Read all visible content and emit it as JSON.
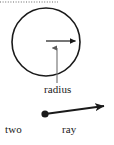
{
  "figure": {
    "background_color": "#ffffff",
    "stroke_color": "#1a1a1a",
    "width": 114,
    "height": 145
  },
  "top_edge": {
    "name": "dotted-rule",
    "style": "dotted",
    "color": "#9a9a9a",
    "y": 2,
    "x_start": 0,
    "x_end": 58
  },
  "circle": {
    "center_x": 46,
    "center_y": 42,
    "radius": 34,
    "stroke_width": 1.6,
    "stroke_color": "#1a1a1a",
    "fill": "none"
  },
  "radius_arrow": {
    "name": "radius-arrow",
    "from_x": 46,
    "from_y": 41,
    "to_x": 79,
    "to_y": 41,
    "stroke_width": 1.2,
    "stroke_color": "#1a1a1a"
  },
  "leader_line": {
    "name": "radius-leader-line",
    "from_x": 57,
    "from_y": 83,
    "to_x": 57,
    "to_y": 43,
    "stroke_width": 1.1,
    "stroke_color": "#6e6e6e"
  },
  "ray": {
    "name": "ray-arrow",
    "endpoint_x": 45,
    "endpoint_y": 114,
    "tip_x": 112,
    "tip_y": 105,
    "dot_radius": 3.6,
    "stroke_width": 1.8,
    "stroke_color": "#1a1a1a"
  },
  "labels": {
    "radius": "radius",
    "two": "two",
    "ray": "ray"
  }
}
